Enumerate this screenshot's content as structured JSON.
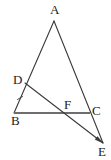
{
  "figure": {
    "type": "geometry-diagram",
    "width": 111,
    "height": 160,
    "background_color": "#ffffff",
    "stroke_color": "#3a3a3a",
    "highlight_stroke_color": "#6e6e6e",
    "label_color": "#1b1b1b"
  },
  "labels": {
    "a": "A",
    "b": "B",
    "c": "C",
    "d": "D",
    "e": "E",
    "f": "F"
  },
  "points": {
    "A": {
      "x": 54,
      "y": 21
    },
    "B": {
      "x": 14,
      "y": 113
    },
    "C": {
      "x": 90,
      "y": 113
    },
    "D": {
      "x": 25,
      "y": 83
    },
    "E": {
      "x": 103,
      "y": 143
    },
    "F": {
      "x": 67,
      "y": 113
    }
  },
  "segments": [
    {
      "name": "segment-AB",
      "from": "A",
      "to": "B",
      "style": "thin"
    },
    {
      "name": "segment-AE",
      "from": "A",
      "to": "E",
      "style": "thin"
    },
    {
      "name": "segment-BC",
      "from": "B",
      "to": "C",
      "style": "thick"
    },
    {
      "name": "segment-DE",
      "from": "D",
      "to": "E",
      "style": "thin"
    }
  ],
  "marks": {
    "tick_on_BD": {
      "name": "tick-mark-bd",
      "x": 20,
      "y": 98
    },
    "arrowhead_at_E": {
      "name": "arrowhead-e"
    }
  }
}
